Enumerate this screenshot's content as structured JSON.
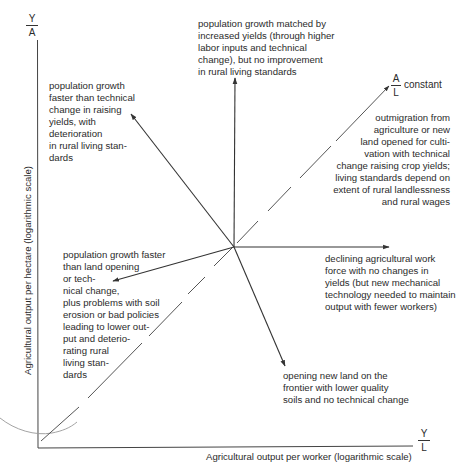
{
  "axes": {
    "y_symbol": {
      "num": "Y",
      "den": "A"
    },
    "x_symbol": {
      "num": "Y",
      "den": "L"
    },
    "y_label": "Agricultural output per hectare (logarithmic scale)",
    "x_label": "Agricultural output per worker (logarithmic scale)"
  },
  "diagonal": {
    "symbol": {
      "num": "A",
      "den": "L"
    },
    "label": "constant"
  },
  "annotations": {
    "up": "population growth matched by\nincreased yields (through higher\nlabor inputs and technical\nchange), but no improvement\nin rural living standards",
    "upper_left": "population growth\nfaster than technical\nchange in raising\nyields, with\ndeterioration\nin rural living stan-\ndards",
    "upper_right": "outmigration from\nagriculture or new\nland opened for culti-\nvation with technical\nchange raising crop yields;\nliving standards depend on\nextent of rural landlessness\nand rural wages",
    "right": "declining agricultural work\nforce with no changes in\nyields (but new mechanical\ntechnology needed to maintain\noutput with fewer workers)",
    "lower_left": "population growth faster\nthan land opening\nor tech-\nnical change,\nplus problems with soil\nerosion or bad policies\nleading to lower out-\nput and deterio-\nrating rural\nliving stan-\ndards",
    "down": "opening new land on the\nfrontier with lower quality\nsoils and no technical change"
  },
  "colors": {
    "line": "#333333",
    "dashed": "#555555",
    "curve": "#8a8a8a",
    "text": "#2b2b2b"
  }
}
